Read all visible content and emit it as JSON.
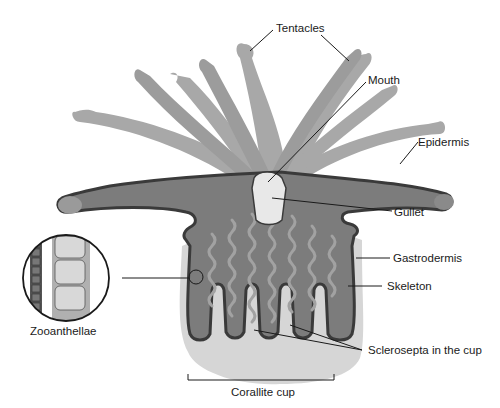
{
  "diagram": {
    "labels": {
      "tentacles": "Tentacles",
      "mouth": "Mouth",
      "epidermis": "Epidermis",
      "gullet": "Gullet",
      "gastrodermis": "Gastrodermis",
      "skeleton": "Skeleton",
      "sclerosepta": "Sclerosepta in the cup",
      "zooanthellae": "Zooanthellae",
      "corallite_cup": "Corallite cup"
    },
    "colors": {
      "tentacle_light": "#a8a8a8",
      "tentacle_mid": "#9a9a9a",
      "body_dark": "#7c7c7c",
      "outline": "#3a3a3a",
      "skeleton": "#d6d6d6",
      "gullet": "#e8e8e8",
      "zooxanthellae_wave": "#a2a2a2",
      "label_text": "#1a1a1a"
    }
  }
}
